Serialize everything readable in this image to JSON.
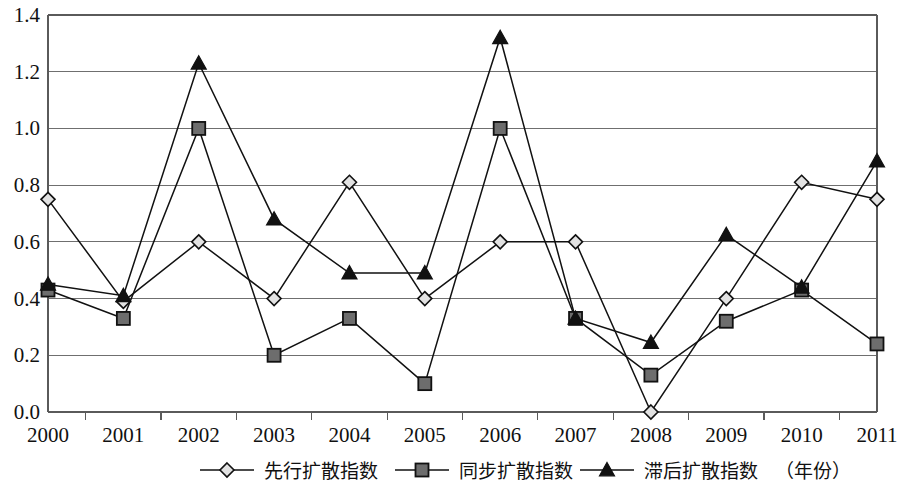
{
  "chart_data": {
    "type": "line",
    "title": "",
    "xlabel": "（年份）",
    "ylabel": "",
    "categories": [
      "2000",
      "2001",
      "2002",
      "2003",
      "2004",
      "2005",
      "2006",
      "2007",
      "2008",
      "2009",
      "2010",
      "2011"
    ],
    "ylim": [
      0.0,
      1.4
    ],
    "yticks": [
      "0.0",
      "0.2",
      "0.4",
      "0.6",
      "0.8",
      "1.0",
      "1.2",
      "1.4"
    ],
    "ytick_values": [
      0.0,
      0.2,
      0.4,
      0.6,
      0.8,
      1.0,
      1.2,
      1.4
    ],
    "grid": true,
    "legend_position": "bottom",
    "series": [
      {
        "name": "先行扩散指数",
        "marker": "diamond",
        "values": [
          0.75,
          0.39,
          0.6,
          0.4,
          0.81,
          0.4,
          0.6,
          0.6,
          0.0,
          0.4,
          0.81,
          0.75
        ]
      },
      {
        "name": "同步扩散指数",
        "marker": "square",
        "values": [
          0.43,
          0.33,
          1.0,
          0.2,
          0.33,
          0.1,
          1.0,
          0.33,
          0.13,
          0.32,
          0.43,
          0.24
        ]
      },
      {
        "name": "滞后扩散指数",
        "marker": "triangle",
        "values": [
          0.45,
          0.41,
          1.23,
          0.68,
          0.49,
          0.49,
          1.32,
          0.33,
          0.245,
          0.625,
          0.44,
          0.885
        ]
      }
    ]
  },
  "legend": {
    "entries": [
      {
        "label": "先行扩散指数",
        "marker": "diamond"
      },
      {
        "label": "同步扩散指数",
        "marker": "square"
      },
      {
        "label": "滞后扩散指数",
        "marker": "triangle"
      }
    ],
    "axis_note": "（年份）"
  },
  "colors": {
    "line": "#111111",
    "grid": "#6f6f6f",
    "axis": "#5a5a5a",
    "diamond_fill": "#e2e2e2",
    "square_fill": "#6d6d6d",
    "triangle_fill": "#111111",
    "background": "#ffffff"
  }
}
